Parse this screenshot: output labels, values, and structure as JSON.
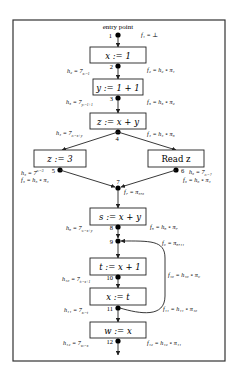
{
  "diagram": {
    "entry_label": "entry point",
    "nodes": [
      {
        "id": "1",
        "label": "1"
      },
      {
        "id": "2",
        "label": "2"
      },
      {
        "id": "3",
        "label": "3"
      },
      {
        "id": "4",
        "label": "4"
      },
      {
        "id": "5",
        "label": "5"
      },
      {
        "id": "6",
        "label": "6"
      },
      {
        "id": "7",
        "label": "7"
      },
      {
        "id": "8",
        "label": "8"
      },
      {
        "id": "9",
        "label": "9"
      },
      {
        "id": "10",
        "label": "10"
      },
      {
        "id": "11",
        "label": "11"
      },
      {
        "id": "12",
        "label": "12"
      }
    ],
    "statements": {
      "x_assign_1": "x := 1",
      "y_assign_1p1": "y := 1 + 1",
      "z_assign_xpy": "z := x + y",
      "z_assign_3": "z := 3",
      "read_z": "Read z",
      "s_assign_xpy": "s := x + y",
      "t_assign_xp1": "t := x + 1",
      "x_assign_t": "x := t",
      "w_assign_x": "w := x"
    },
    "f_labels": {
      "f1": "f₁ = ⊥",
      "f2": "f₂ = h₂ ∘ π₁",
      "f3": "f₃ = h₃ ∘ π₂",
      "f4": "f₄ = h₄ ∘ π₃",
      "f5": "f₅ = h₅ ∘ π₄",
      "f6": "f₆ = h₆ ∘ π₄",
      "f7": "f₇ = π₅,₆",
      "f8": "f₈ = h₈ ∘ π₇",
      "f9": "f₉ = π₈,₁₁",
      "f10": "f₁₀ = h₁₀ ∘ π₉",
      "f11": "f₁₁ = h₁₁ ∘ π₁₀",
      "f12": "f₁₂ = h₁₂ ∘ π₁₁"
    },
    "h_labels": {
      "h2": "h₂ = 7",
      "h2_sub": "x:=1",
      "h3": "h₃ = 7",
      "h3_sub": "y:=1+1",
      "h4": "h₄ = 7",
      "h4_sub": "z:=x+y",
      "h5": "h₅ = 7",
      "h5_sub": "z:=3",
      "h6": "h₆ = 7",
      "h6_sub": "z:=?",
      "h8": "h₈ = 7",
      "h8_sub": "s:=x+y",
      "h10": "h₁₀ = 7",
      "h10_sub": "t:=x+1",
      "h11": "h₁₁ = 7",
      "h11_sub": "x:=t",
      "h12": "h₁₂ = 7",
      "h12_sub": "w:=x"
    }
  }
}
